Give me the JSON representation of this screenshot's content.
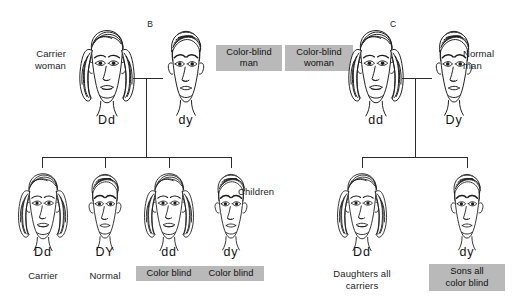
{
  "figure": {
    "type": "pedigree-diagram",
    "panels": [
      {
        "id": "B",
        "label": "B"
      },
      {
        "id": "C",
        "label": "C"
      }
    ]
  },
  "panel_b": {
    "letter": "B",
    "parents": [
      {
        "role": "mother",
        "side_label": "Carrier\nwoman",
        "genotype": "Dd",
        "tag": null,
        "sex": "female"
      },
      {
        "role": "father",
        "side_label": null,
        "genotype": "dy",
        "tag": "Color-blind\nman",
        "sex": "male"
      }
    ],
    "children": [
      {
        "genotype": "Dd",
        "status": "Carrier",
        "tag": null,
        "sex": "female"
      },
      {
        "genotype": "DY",
        "status": "Normal",
        "tag": null,
        "sex": "male"
      },
      {
        "genotype": "dd",
        "status": null,
        "tag": "Color blind",
        "sex": "female"
      },
      {
        "genotype": "dy",
        "status": null,
        "tag": "Color blind",
        "sex": "male"
      }
    ]
  },
  "panel_c": {
    "letter": "C",
    "parents": [
      {
        "role": "mother",
        "side_label": null,
        "genotype": "dd",
        "tag": "Color-blind\nwoman",
        "sex": "female"
      },
      {
        "role": "father",
        "side_label": "Normal\nman",
        "genotype": "Dy",
        "tag": null,
        "sex": "male"
      }
    ],
    "children": [
      {
        "genotype": "Dd",
        "status": "Daughters all\ncarriers",
        "tag": null,
        "sex": "female"
      },
      {
        "genotype": "dy",
        "status": null,
        "tag": "Sons all\ncolor blind",
        "sex": "male"
      }
    ]
  },
  "labels": {
    "children_row": "Children"
  },
  "colors": {
    "tag_background": "#b9b9b9",
    "ink": "#1d1d1d",
    "line": "#2b2b2b",
    "page_background": "#ffffff"
  }
}
